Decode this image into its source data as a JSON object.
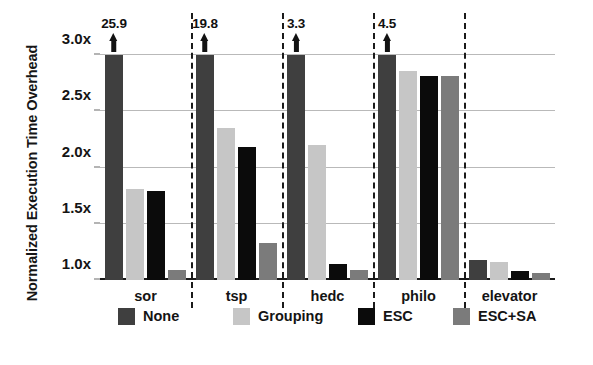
{
  "chart_data": {
    "type": "bar",
    "title": "",
    "xlabel": "",
    "ylabel": "Normalized Execution Time Overhead",
    "categories": [
      "sor",
      "tsp",
      "hedc",
      "philo",
      "elevator"
    ],
    "ylim": [
      1.0,
      3.0
    ],
    "ytick_labels": [
      "1.0x",
      "1.5x",
      "2.0x",
      "2.5x",
      "3.0x"
    ],
    "ytick_values": [
      1.0,
      1.5,
      2.0,
      2.5,
      3.0
    ],
    "grid": true,
    "legend_position": "bottom",
    "series": [
      {
        "name": "None",
        "color": "#3f3f3f",
        "values": [
          25.9,
          19.8,
          3.3,
          4.5,
          1.18
        ],
        "clipped": [
          true,
          true,
          true,
          true,
          false
        ]
      },
      {
        "name": "Grouping",
        "color": "#c6c6c6",
        "values": [
          1.81,
          2.35,
          2.2,
          2.86,
          1.16
        ],
        "clipped": [
          false,
          false,
          false,
          false,
          false
        ]
      },
      {
        "name": "ESC",
        "color": "#0b0b0b",
        "values": [
          1.79,
          2.18,
          1.14,
          2.81,
          1.08
        ],
        "clipped": [
          false,
          false,
          false,
          false,
          false
        ]
      },
      {
        "name": "ESC+SA",
        "color": "#7b7b7b",
        "values": [
          1.09,
          1.33,
          1.09,
          2.81,
          1.06
        ],
        "clipped": [
          false,
          false,
          false,
          false,
          false
        ]
      }
    ],
    "annotations": [
      {
        "category": "sor",
        "series": "None",
        "label": "25.9",
        "marker": "up-arrow"
      },
      {
        "category": "tsp",
        "series": "None",
        "label": "19.8",
        "marker": "up-arrow"
      },
      {
        "category": "hedc",
        "series": "None",
        "label": "3.3",
        "marker": "up-arrow"
      },
      {
        "category": "philo",
        "series": "None",
        "label": "4.5",
        "marker": "up-arrow"
      }
    ]
  }
}
